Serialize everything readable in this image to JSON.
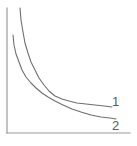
{
  "figure": {
    "name": "two-decay-curves-figure",
    "background_color": "#ffffff",
    "axis_color": "#9a9a9a",
    "curve_color": "#6e6e6e",
    "label_color": "#5a5a5a",
    "axes": {
      "y_axis": {
        "x": 7,
        "y_top": 8,
        "y_bottom": 133
      },
      "x_axis": {
        "y": 133,
        "x_left": 7,
        "x_right": 130
      },
      "ticks": [],
      "tick_labels": [],
      "xlabel": "",
      "ylabel": "",
      "grid": false
    },
    "labels": {
      "curve_1": "1",
      "curve_2": "2"
    }
  },
  "chart_data": {
    "type": "line",
    "title": "",
    "subtitle": "",
    "xlabel": "",
    "ylabel": "",
    "xlim": [
      0,
      137
    ],
    "ylim": [
      146,
      0
    ],
    "grid": false,
    "legend": "inline-right-end-labels",
    "annotations": [
      {
        "text": "1",
        "x": 116,
        "y": 101,
        "target_series": "1"
      },
      {
        "text": "2",
        "x": 116,
        "y": 126,
        "target_series": "2"
      }
    ],
    "series": [
      {
        "name": "1",
        "label": "1",
        "description": "upper curve: steeper near the y-axis, flatter asymptotic tail ending higher on the right",
        "color": "#6e6e6e",
        "points": [
          [
            20,
            8
          ],
          [
            21,
            20
          ],
          [
            23,
            32
          ],
          [
            25,
            43
          ],
          [
            28,
            53
          ],
          [
            31,
            62
          ],
          [
            35,
            70
          ],
          [
            39,
            78
          ],
          [
            44,
            85
          ],
          [
            49,
            91
          ],
          [
            55,
            96
          ],
          [
            62,
            99
          ],
          [
            69,
            101
          ],
          [
            77,
            103
          ],
          [
            86,
            104
          ],
          [
            95,
            105
          ],
          [
            104,
            106
          ],
          [
            112,
            107
          ]
        ]
      },
      {
        "name": "2",
        "label": "2",
        "description": "lower curve: starts lower on the left, crosses curve 1 near x=47 then falls below it to a lower right end",
        "color": "#6e6e6e",
        "points": [
          [
            13,
            35
          ],
          [
            14,
            45
          ],
          [
            16,
            54
          ],
          [
            19,
            62
          ],
          [
            22,
            70
          ],
          [
            26,
            77
          ],
          [
            31,
            83
          ],
          [
            36,
            88
          ],
          [
            42,
            93
          ],
          [
            48,
            97
          ],
          [
            55,
            101
          ],
          [
            63,
            105
          ],
          [
            72,
            109
          ],
          [
            81,
            112
          ],
          [
            91,
            115
          ],
          [
            101,
            117
          ],
          [
            110,
            118
          ],
          [
            116,
            119
          ]
        ]
      }
    ],
    "crossing_point": {
      "x": 47,
      "y": 96
    }
  }
}
